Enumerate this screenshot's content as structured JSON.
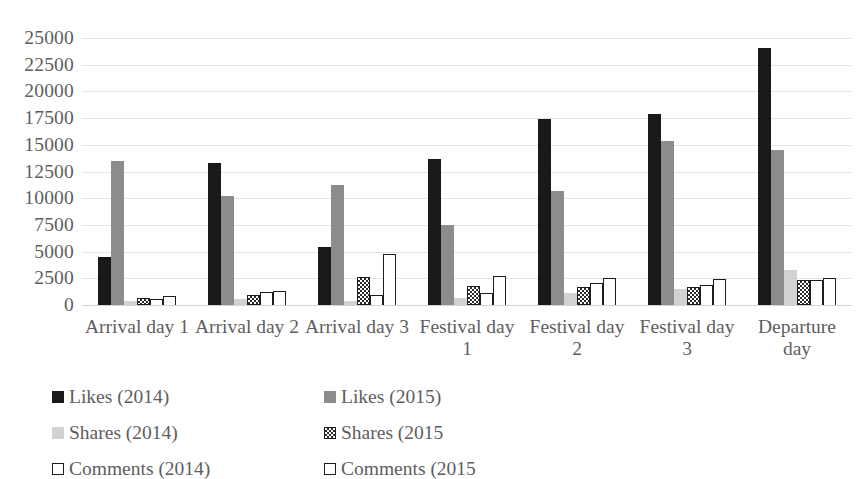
{
  "chart_data": {
    "type": "bar",
    "title": "",
    "xlabel": "",
    "ylabel": "",
    "ylim": [
      0,
      25000
    ],
    "y_ticks": [
      0,
      2500,
      5000,
      7500,
      10000,
      12500,
      15000,
      17500,
      20000,
      22500,
      25000
    ],
    "grid": true,
    "legend_position": "bottom",
    "categories": [
      "Arrival day 1",
      "Arrival day 2",
      "Arrival day 3",
      "Festival day 1",
      "Festival day 2",
      "Festival day 3",
      "Departure day"
    ],
    "series": [
      {
        "name": "Likes (2014)",
        "color": "#191919",
        "values": [
          4500,
          13300,
          5400,
          13700,
          17400,
          17900,
          24100
        ]
      },
      {
        "name": "Likes (2015)",
        "color": "#8c8c8c",
        "values": [
          13500,
          10250,
          11200,
          7450,
          10700,
          15350,
          14500
        ]
      },
      {
        "name": "Shares (2014)",
        "color": "#d2d2d2",
        "values": [
          400,
          550,
          350,
          700,
          1150,
          1500,
          3300
        ]
      },
      {
        "name": "Shares (2015",
        "color": "#2b2b2b",
        "values": [
          700,
          900,
          2600,
          1750,
          1700,
          1700,
          2300
        ]
      },
      {
        "name": "Comments (2014)",
        "color": "#ffffff",
        "values": [
          600,
          1250,
          900,
          1100,
          2050,
          1900,
          2350
        ]
      },
      {
        "name": "Comments (2015",
        "color": "#ffffff",
        "values": [
          850,
          1300,
          4800,
          2700,
          2550,
          2400,
          2500
        ]
      }
    ]
  },
  "axis": {
    "y_tick_labels": [
      "25000",
      "22500",
      "20000",
      "17500",
      "15000",
      "12500",
      "10000",
      "7500",
      "5000",
      "2500",
      "0"
    ],
    "category_labels": [
      "Arrival day 1",
      "Arrival day 2",
      "Arrival day 3",
      "Festival day 1",
      "Festival day 2",
      "Festival day 3",
      "Departure day"
    ]
  },
  "legend": {
    "items": [
      {
        "label": "Likes (2014)",
        "swatch": "likes-2014-swatch"
      },
      {
        "label": "Likes (2015)",
        "swatch": "likes-2015-swatch"
      },
      {
        "label": "Shares (2014)",
        "swatch": "shares-2014-swatch"
      },
      {
        "label": "Shares (2015",
        "swatch": "shares-2015-swatch"
      },
      {
        "label": "Comments (2014)",
        "swatch": "comments-2014-swatch"
      },
      {
        "label": "Comments (2015",
        "swatch": "comments-2015-swatch"
      }
    ]
  }
}
